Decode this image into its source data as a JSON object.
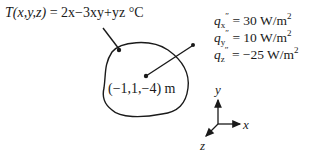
{
  "equation": {
    "lhs": "T(x,y,z)",
    "rhs": " = 2x−3xy+yz",
    "unit": " °C"
  },
  "heat_flux": [
    {
      "symbol": "q",
      "sub": "x",
      "prime": "″",
      "value": " = 30 W/m",
      "exp": "2"
    },
    {
      "symbol": "q",
      "sub": "y",
      "prime": "″",
      "value": " = 10 W/m",
      "exp": "2"
    },
    {
      "symbol": "q",
      "sub": "z",
      "prime": "″",
      "value": " = −25 W/m",
      "exp": "2"
    }
  ],
  "point_label": "(−1,1,−4) m",
  "axes": {
    "x": "x",
    "y": "y",
    "z": "z"
  }
}
